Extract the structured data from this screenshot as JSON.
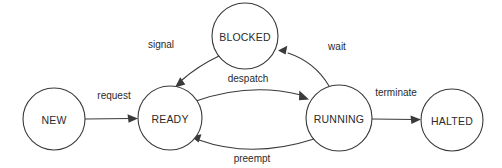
{
  "diagram": {
    "type": "state-machine",
    "background_color": "#ffffff",
    "stroke_color": "#3a3a3a",
    "text_color": "#2b2b2b",
    "states": [
      {
        "id": "new",
        "label": "NEW",
        "cx": 54,
        "cy": 119,
        "r": 31
      },
      {
        "id": "ready",
        "label": "READY",
        "cx": 170,
        "cy": 118,
        "r": 32
      },
      {
        "id": "blocked",
        "label": "BLOCKED",
        "cx": 245,
        "cy": 36,
        "r": 33
      },
      {
        "id": "running",
        "label": "RUNNING",
        "cx": 339,
        "cy": 118,
        "r": 33
      },
      {
        "id": "halted",
        "label": "HALTED",
        "cx": 452,
        "cy": 120,
        "r": 31
      }
    ],
    "transitions": [
      {
        "id": "request",
        "label": "request",
        "from": "new",
        "to": "ready",
        "label_x": 114,
        "label_y": 95
      },
      {
        "id": "despatch",
        "label": "despatch",
        "from": "ready",
        "to": "running",
        "label_x": 248,
        "label_y": 78
      },
      {
        "id": "preempt",
        "label": "preempt",
        "from": "running",
        "to": "ready",
        "label_x": 252,
        "label_y": 158
      },
      {
        "id": "wait",
        "label": "wait",
        "from": "running",
        "to": "blocked",
        "label_x": 337,
        "label_y": 46
      },
      {
        "id": "signal",
        "label": "signal",
        "from": "blocked",
        "to": "ready",
        "label_x": 161,
        "label_y": 44
      },
      {
        "id": "terminate",
        "label": "terminate",
        "from": "running",
        "to": "halted",
        "label_x": 396,
        "label_y": 92
      }
    ]
  }
}
